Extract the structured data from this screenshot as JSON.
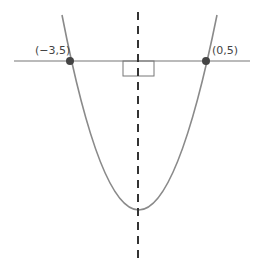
{
  "diagram": {
    "type": "parabola-symmetry",
    "points": [
      {
        "label": "(−3,5)",
        "x": -3,
        "y": 5
      },
      {
        "label": "(0,5)",
        "x": 0,
        "y": 5
      }
    ],
    "axis_of_symmetry": "dashed vertical line",
    "horizontal_line": "y = 5",
    "right_angle_marker": true,
    "colors": {
      "curve": "#8a8a8a",
      "line": "#777777",
      "axis": "#333333",
      "point": "#444444"
    }
  }
}
